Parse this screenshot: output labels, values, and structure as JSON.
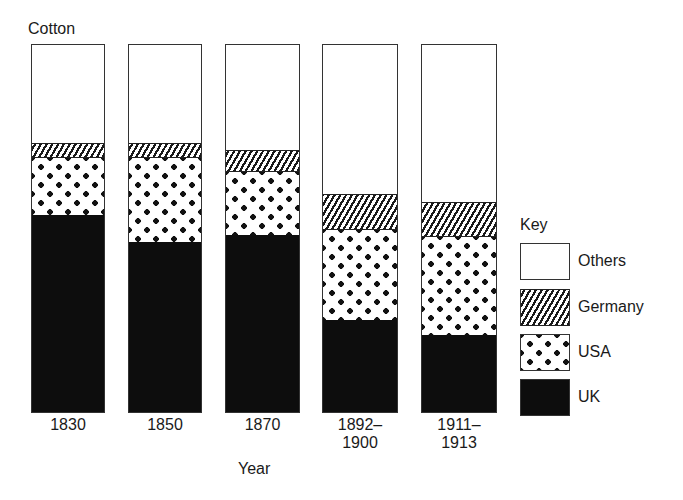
{
  "chart_data": {
    "type": "bar",
    "stacked": true,
    "normalized_percent": true,
    "title": "Cotton",
    "xlabel": "Year",
    "ylabel": "",
    "ylim": [
      0,
      100
    ],
    "grid": false,
    "legend_title": "Key",
    "legend_position": "right",
    "categories": [
      "1830",
      "1850",
      "1870",
      "1892–1900",
      "1911–1913"
    ],
    "category_lines": [
      [
        "1830"
      ],
      [
        "1850"
      ],
      [
        "1870"
      ],
      [
        "1892–",
        "1900"
      ],
      [
        "1911–",
        "1913"
      ]
    ],
    "series": [
      {
        "name": "UK",
        "pattern": "solid-black",
        "values": [
          53.7,
          46.3,
          48.2,
          25.2,
          21.1
        ]
      },
      {
        "name": "USA",
        "pattern": "dots",
        "values": [
          15.7,
          22.8,
          17.3,
          24.4,
          26.6
        ]
      },
      {
        "name": "Germany",
        "pattern": "diagonal-hatch",
        "values": [
          4.1,
          4.3,
          6.0,
          9.8,
          9.5
        ]
      },
      {
        "name": "Others",
        "pattern": "white",
        "values": [
          26.6,
          26.6,
          28.5,
          40.7,
          42.8
        ]
      }
    ],
    "legend_order": [
      "Others",
      "Germany",
      "USA",
      "UK"
    ]
  },
  "labels": {
    "title": "Cotton",
    "xlabel": "Year",
    "key_title": "Key",
    "ticks": [
      {
        "line1": "1830",
        "line2": ""
      },
      {
        "line1": "1850",
        "line2": ""
      },
      {
        "line1": "1870",
        "line2": ""
      },
      {
        "line1": "1892–",
        "line2": "1900"
      },
      {
        "line1": "1911–",
        "line2": "1913"
      }
    ],
    "key": [
      "Others",
      "Germany",
      "USA",
      "UK"
    ]
  },
  "colors": {
    "uk": "#0d0d0d",
    "others": "#ffffff",
    "outline": "#333333"
  }
}
